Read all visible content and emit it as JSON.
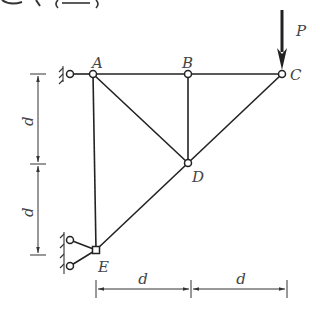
{
  "header": {
    "fragment": ""
  },
  "diagram": {
    "type": "truss",
    "joints": {
      "A": {
        "label": "A",
        "x": 93,
        "y": 74
      },
      "B": {
        "label": "B",
        "x": 188,
        "y": 74
      },
      "C": {
        "label": "C",
        "x": 282,
        "y": 74
      },
      "D": {
        "label": "D",
        "x": 188,
        "y": 163
      },
      "E": {
        "label": "E",
        "x": 96,
        "y": 250
      }
    },
    "members": [
      [
        "A",
        "B"
      ],
      [
        "B",
        "C"
      ],
      [
        "A",
        "E"
      ],
      [
        "A",
        "D"
      ],
      [
        "B",
        "D"
      ],
      [
        "C",
        "D"
      ],
      [
        "D",
        "E"
      ]
    ],
    "load": {
      "label": "P",
      "at": "C",
      "direction": "down"
    },
    "dimensions": {
      "vertical": [
        {
          "label": "d"
        },
        {
          "label": "d"
        }
      ],
      "horizontal": [
        {
          "label": "d"
        },
        {
          "label": "d"
        }
      ]
    },
    "colors": {
      "line": "#222222",
      "label": "#444444",
      "background": "#ffffff"
    }
  }
}
